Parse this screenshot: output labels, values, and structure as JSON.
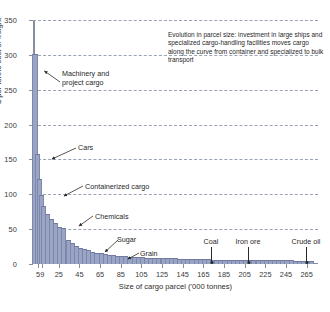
{
  "chart_data": {
    "type": "bar",
    "title": "",
    "xlabel": "Size of cargo parcel ('000 tonnes)",
    "ylabel": "$ per tonne cost of freight",
    "ylim": [
      0,
      350
    ],
    "ytick_labels": [
      "0",
      "50",
      "100",
      "150",
      "200",
      "250",
      "300",
      "350"
    ],
    "ytick_values": [
      0,
      50,
      100,
      150,
      200,
      250,
      300,
      350
    ],
    "grid": true,
    "grid_style": "dashed-horizontal",
    "legend": "none",
    "bar_color": "#9aa4c4",
    "xtick_labels": [
      "5",
      "9",
      "25",
      "45",
      "65",
      "85",
      "105",
      "125",
      "145",
      "165",
      "185",
      "205",
      "225",
      "245",
      "265"
    ],
    "xtick_values": [
      5,
      9,
      25,
      45,
      65,
      85,
      105,
      125,
      145,
      165,
      185,
      205,
      225,
      245,
      265
    ],
    "x": [
      1,
      3,
      5,
      7,
      9,
      13,
      17,
      21,
      25,
      29,
      33,
      37,
      41,
      45,
      49,
      53,
      57,
      61,
      65,
      69,
      73,
      77,
      81,
      85,
      89,
      93,
      97,
      101,
      105,
      109,
      113,
      117,
      121,
      125,
      129,
      133,
      137,
      141,
      145,
      149,
      153,
      157,
      161,
      165,
      169,
      173,
      177,
      181,
      185,
      189,
      193,
      197,
      201,
      205,
      209,
      213,
      217,
      221,
      225,
      229,
      233,
      237,
      241,
      245,
      249,
      253,
      257,
      261,
      265,
      269
    ],
    "values": [
      300,
      157,
      120,
      97,
      82,
      70,
      63,
      57,
      52,
      50,
      33,
      28,
      25,
      22,
      20,
      18,
      16,
      15,
      14,
      13,
      12,
      11,
      10.5,
      10,
      9.5,
      9,
      8.5,
      8,
      8,
      7.5,
      7.5,
      7,
      7,
      7,
      6.5,
      6.5,
      6.5,
      6,
      6,
      6,
      6,
      5.5,
      5.5,
      5.5,
      5.5,
      5,
      5,
      5,
      5,
      5,
      4.5,
      4.5,
      4.5,
      4.5,
      4.5,
      4.5,
      4,
      4,
      4,
      4,
      4,
      4,
      4,
      4,
      4,
      3.5,
      3.5,
      3.5,
      3.5,
      3.5
    ]
  },
  "annotation": {
    "text": "Evolution in parcel size: investment in large ships and specialized cargo-handling facilities moves cargo along the curve from container and specialized to bulk transport"
  },
  "callouts": [
    {
      "label_line1": "Machinery and",
      "label_line2": "project cargo"
    },
    {
      "label": "Cars"
    },
    {
      "label": "Containerized cargo"
    },
    {
      "label": "Chemicals"
    },
    {
      "label": "Sugar"
    },
    {
      "label": "Grain"
    }
  ],
  "pointers": [
    {
      "label": "Coal"
    },
    {
      "label": "Iron ore"
    },
    {
      "label": "Crude oil"
    }
  ]
}
